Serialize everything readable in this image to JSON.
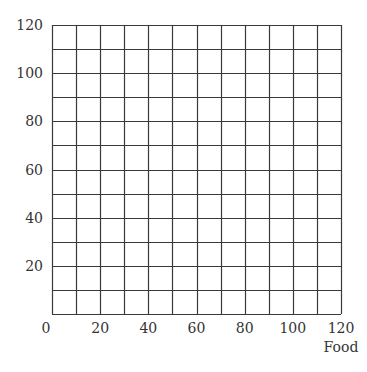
{
  "chart_data": {
    "type": "line",
    "title": "",
    "xlabel": "Food",
    "ylabel": "",
    "xlim": [
      0,
      120
    ],
    "ylim": [
      0,
      120
    ],
    "x_ticks": [
      0,
      20,
      40,
      60,
      80,
      100,
      120
    ],
    "y_ticks": [
      20,
      40,
      60,
      80,
      100,
      120
    ],
    "x_tick_labels": [
      "0",
      "20",
      "40",
      "60",
      "80",
      "100",
      "120"
    ],
    "y_tick_labels": [
      "20",
      "40",
      "60",
      "80",
      "100",
      "120"
    ],
    "grid": true,
    "grid_step": 10,
    "series": [],
    "legend": null
  },
  "style": {
    "grid_color": "#3a3a3a",
    "background": "#ffffff"
  }
}
